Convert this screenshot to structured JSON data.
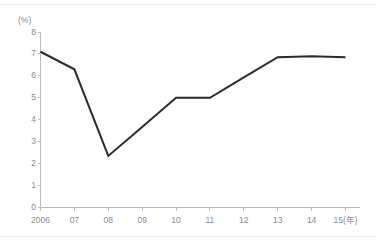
{
  "chart_data": {
    "type": "line",
    "title": "",
    "subtitle": "",
    "xlabel": "",
    "ylabel": "",
    "unit_label": "(%)",
    "x_axis_note": "15(年)",
    "categories": [
      "2006",
      "07",
      "08",
      "09",
      "10",
      "11",
      "12",
      "13",
      "14",
      "15(年)"
    ],
    "x_tick_labels": [
      "2006",
      "07",
      "08",
      "09",
      "10",
      "11",
      "12",
      "13",
      "14",
      "15(年)"
    ],
    "y_tick_labels": [
      "8",
      "7",
      "6",
      "5",
      "4",
      "3",
      "2",
      "1",
      "0"
    ],
    "values": [
      7.1,
      6.3,
      2.35,
      3.67,
      5.0,
      5.0,
      5.93,
      6.85,
      6.9,
      6.85
    ],
    "series": [
      {
        "name": "",
        "values": [
          7.1,
          6.3,
          2.35,
          3.67,
          5.0,
          5.0,
          5.93,
          6.85,
          6.9,
          6.85
        ],
        "color": "#2b2b2b"
      }
    ],
    "ylim": [
      0,
      8
    ],
    "y_tick_step": 1,
    "grid": false,
    "legend": false,
    "legend_position": "none",
    "annotations": []
  },
  "style": {
    "background": "#ffffff",
    "axis_color": "#b9b9b9",
    "tick_color": "#bdbdbd",
    "label_color": "#8a8a8a",
    "line_color": "#2b2b2b",
    "frame_rule_color": "#e8e8e8"
  }
}
